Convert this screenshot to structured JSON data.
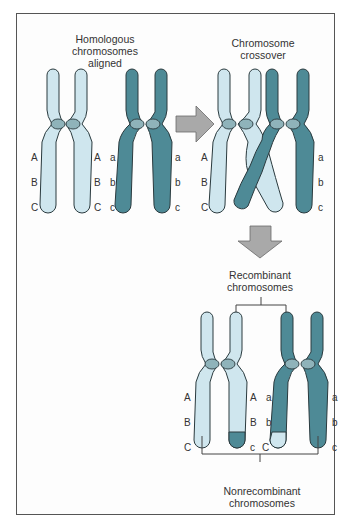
{
  "colors": {
    "light_chromosome": "#cfe6ee",
    "dark_chromosome": "#4e8a96",
    "centromere_light": "#8fb3ba",
    "outline": "#2a3a3e",
    "arrow": "#a9a9a9",
    "frame": "#555555"
  },
  "panels": {
    "aligned": {
      "label": "Homologous\nchromosomes\naligned"
    },
    "crossover": {
      "label": "Chromosome\ncrossover"
    },
    "recombinant": {
      "label": "Recombinant\nchromosomes"
    },
    "nonrecombinant": {
      "label": "Nonrecombinant\nchromosomes"
    }
  },
  "genes": {
    "upper_case": [
      "A",
      "B",
      "C"
    ],
    "lower_case": [
      "a",
      "b",
      "c"
    ]
  },
  "result_genes": {
    "light_left": [
      "A",
      "B",
      "C"
    ],
    "light_right": [
      "A",
      "B",
      "c"
    ],
    "dark_left": [
      "a",
      "b",
      "C"
    ],
    "dark_right": [
      "a",
      "b",
      "c"
    ]
  },
  "arrows": {
    "right": "arrow-right",
    "down": "arrow-down"
  }
}
